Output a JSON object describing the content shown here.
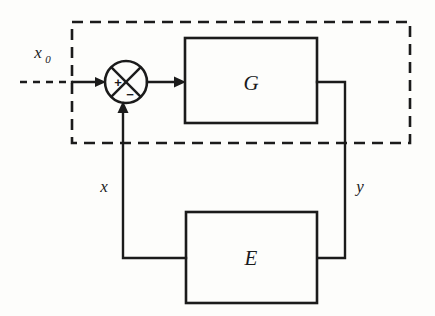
{
  "diagram": {
    "type": "block-diagram",
    "background_color": "#fdfdfb",
    "line_color": "#1b1b1b",
    "blocks": [
      {
        "id": "G",
        "label": "G",
        "description": "forward path plant block"
      },
      {
        "id": "E",
        "label": "E",
        "description": "feedback path element block"
      }
    ],
    "summing_junction": {
      "name": "summing-junction",
      "plus_sign": "+",
      "minus_sign": "−",
      "style": "circle-with-x-cross"
    },
    "signals": {
      "input": {
        "label": "x",
        "subscript": "0",
        "full": "x0"
      },
      "feedback": {
        "label": "x"
      },
      "output": {
        "label": "y"
      }
    },
    "boundary": {
      "name": "system-boundary",
      "style": "dashed-rectangle"
    }
  }
}
